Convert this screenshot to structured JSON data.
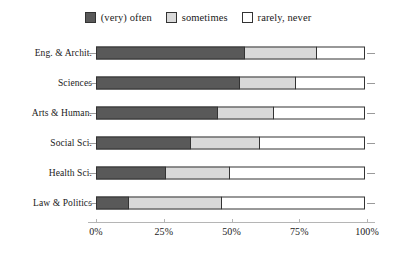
{
  "chart_data": {
    "type": "bar",
    "orientation": "horizontal",
    "stacked": true,
    "normalized": true,
    "title": "",
    "subtitle": "",
    "xlabel": "",
    "ylabel": "",
    "xlim": [
      0,
      100
    ],
    "grid": false,
    "legend_position": "top-center",
    "categories": [
      "Eng. & Archit.",
      "Sciences",
      "Arts & Human.",
      "Social Sci.",
      "Health Sci.",
      "Law & Politics"
    ],
    "series": [
      {
        "name": "(very) often",
        "color": "#595959",
        "values": [
          55,
          53,
          45,
          35,
          26,
          12
        ]
      },
      {
        "name": "sometimes",
        "color": "#d9d9d9",
        "values": [
          27,
          21,
          21,
          26,
          24,
          35
        ]
      },
      {
        "name": "rarely, never",
        "color": "#ffffff",
        "values": [
          18,
          26,
          34,
          39,
          50,
          53
        ]
      }
    ],
    "xticks": [
      0,
      25,
      50,
      75,
      100
    ],
    "xticklabels": [
      "0%",
      "25%",
      "50%",
      "75%",
      "100%"
    ]
  },
  "legend": {
    "entries": [
      {
        "label": "(very) often",
        "color": "#595959"
      },
      {
        "label": "sometimes",
        "color": "#d9d9d9"
      },
      {
        "label": "rarely, never",
        "color": "#ffffff"
      }
    ]
  },
  "colors": {
    "often": "#595959",
    "sometimes": "#d9d9d9",
    "rarely_never": "#ffffff",
    "outline": "#333333",
    "axis": "#b5b5b5",
    "background": "#ffffff",
    "text": "#1a1a1a"
  }
}
